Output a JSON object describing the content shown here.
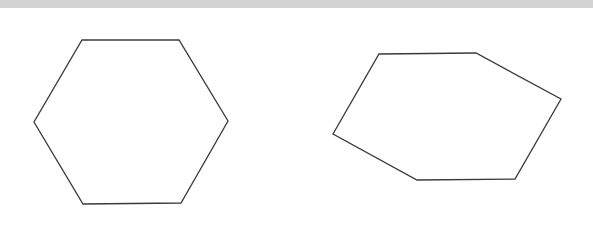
{
  "figure": {
    "stroke_color": "#3a3a3a",
    "band_color": "#d3d3d3",
    "shapes": [
      {
        "name": "hexagon-regular",
        "sides": 6
      },
      {
        "name": "hexagon-rotated",
        "sides": 6
      }
    ]
  }
}
